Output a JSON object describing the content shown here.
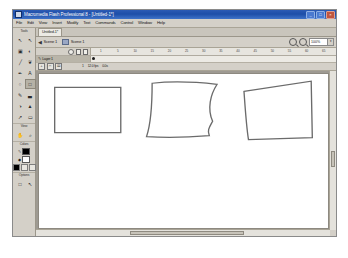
{
  "window": {
    "title": "Macromedia Flash Professional 8 - [Untitled-1*]",
    "app_icon": "flash-icon",
    "minimize_label": "_",
    "maximize_label": "□",
    "close_label": "×"
  },
  "menubar": {
    "items": [
      {
        "label": "File"
      },
      {
        "label": "Edit"
      },
      {
        "label": "View"
      },
      {
        "label": "Insert"
      },
      {
        "label": "Modify"
      },
      {
        "label": "Text"
      },
      {
        "label": "Commands"
      },
      {
        "label": "Control"
      },
      {
        "label": "Window"
      },
      {
        "label": "Help"
      }
    ]
  },
  "tools_panel": {
    "sections": [
      {
        "label": "Tools"
      },
      {
        "label": "View"
      },
      {
        "label": "Colors"
      },
      {
        "label": "Options"
      }
    ],
    "tools": [
      {
        "name": "selection-tool",
        "glyph": "↖",
        "selected": false
      },
      {
        "name": "subselection-tool",
        "glyph": "↖",
        "selected": false
      },
      {
        "name": "free-transform-tool",
        "glyph": "▣",
        "selected": false
      },
      {
        "name": "gradient-transform-tool",
        "glyph": "◐",
        "selected": false
      },
      {
        "name": "line-tool",
        "glyph": "╱",
        "selected": false
      },
      {
        "name": "lasso-tool",
        "glyph": "❦",
        "selected": false
      },
      {
        "name": "pen-tool",
        "glyph": "✒",
        "selected": false
      },
      {
        "name": "text-tool",
        "glyph": "A",
        "selected": false
      },
      {
        "name": "oval-tool",
        "glyph": "○",
        "selected": false
      },
      {
        "name": "rectangle-tool",
        "glyph": "□",
        "selected": true
      },
      {
        "name": "pencil-tool",
        "glyph": "✎",
        "selected": false
      },
      {
        "name": "brush-tool",
        "glyph": "▃",
        "selected": false
      },
      {
        "name": "ink-bottle-tool",
        "glyph": "◑",
        "selected": false
      },
      {
        "name": "paint-bucket-tool",
        "glyph": "▲",
        "selected": false
      },
      {
        "name": "eyedropper-tool",
        "glyph": "↗",
        "selected": false
      },
      {
        "name": "eraser-tool",
        "glyph": "▭",
        "selected": false
      }
    ],
    "view_tools": [
      {
        "name": "hand-tool",
        "glyph": "✋"
      },
      {
        "name": "zoom-tool",
        "glyph": "⌕"
      }
    ],
    "colors": {
      "stroke_icon": "pencil-icon",
      "stroke_color": "#000000",
      "fill_icon": "bucket-icon",
      "fill_color": "#ffffff"
    },
    "options_tools": [
      {
        "name": "object-drawing-toggle",
        "glyph": "□"
      },
      {
        "name": "snap-to-objects-toggle",
        "glyph": "↖"
      }
    ]
  },
  "document": {
    "tab_label": "Untitled-1*"
  },
  "scenebar": {
    "back_label": "◀",
    "back_text": "Scene 1",
    "scene_icon": "scene-icon",
    "scene_label": "Scene 1",
    "zoom_out_icon": "zoom-out-icon",
    "zoom_in_icon": "zoom-in-icon",
    "zoom_value": "100%",
    "zoom_caret": "▾"
  },
  "timeline": {
    "ruler_ticks": [
      "1",
      "5",
      "10",
      "15",
      "20",
      "25",
      "30",
      "35",
      "40",
      "45",
      "50",
      "55",
      "60",
      "65"
    ],
    "header_icons": [
      "eye-icon",
      "lock-icon",
      "outline-icon"
    ],
    "layers": [
      {
        "name": "Layer 1",
        "pencil_icon": "pencil-icon"
      }
    ],
    "footer_icons": [
      {
        "name": "new-layer-icon",
        "glyph": "+"
      },
      {
        "name": "new-folder-icon",
        "glyph": "□"
      },
      {
        "name": "delete-layer-icon",
        "glyph": "⌧"
      }
    ],
    "status": {
      "current_frame": "1",
      "fps": "12.0 fps",
      "elapsed": "0.0s"
    }
  },
  "stage": {
    "shapes": [
      {
        "name": "rectangle-shape",
        "path": "M 14 13 L 73 13 L 73 57 L 14 57 Z",
        "stroke": "#6b6b6b"
      },
      {
        "name": "distorted-trapezoid-shape",
        "path": "M 101 9 C 118 7, 142 8, 159 10 C 153 20, 150 34, 155 46 C 152 52, 150 55, 152 60 C 130 62, 110 62, 96 61 C 100 48, 101 30, 101 9 Z",
        "stroke": "#6b6b6b"
      },
      {
        "name": "slanted-quad-shape",
        "path": "M 183 17 L 243 7 L 244 62 L 187 64 C 185 50, 184 32, 183 17 Z",
        "stroke": "#6b6b6b"
      }
    ]
  },
  "scrollbars": {
    "vertical_name": "stage-vertical-scrollbar",
    "horizontal_name": "stage-horizontal-scrollbar"
  }
}
